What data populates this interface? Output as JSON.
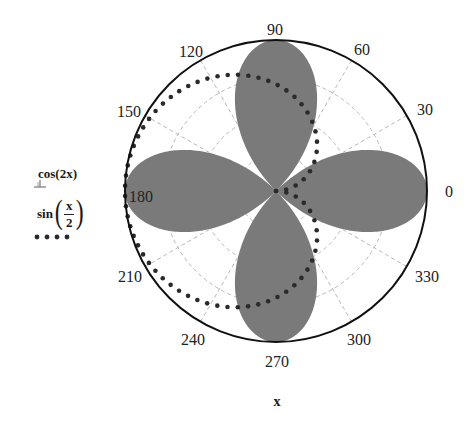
{
  "chart_data": {
    "type": "polar",
    "title": "",
    "xlabel": "x",
    "ylabel": "",
    "theta_unit": "degrees",
    "theta_ticks": [
      0,
      30,
      60,
      90,
      120,
      150,
      180,
      210,
      240,
      270,
      300,
      330
    ],
    "theta_tick_labels": [
      "0",
      "30",
      "60",
      "90",
      "120",
      "150",
      "180",
      "210",
      "240",
      "270",
      "300",
      "330"
    ],
    "r_range": [
      0,
      1
    ],
    "grid": {
      "on": true,
      "style": "dashed",
      "color": "#b8b8b8",
      "radial_lines_every_deg": 30,
      "circles_r": [
        0.25,
        0.5,
        0.75
      ]
    },
    "legend_position": "left",
    "series": [
      {
        "name": "cos(2x)",
        "expression": "r = cos(2x)",
        "style": "filled",
        "color": "#7a7a7a",
        "description": "four-petal rose with petals along 0, 90, 180, 270 degrees, max r = 1",
        "sample_points": [
          {
            "theta": 0,
            "r": 1
          },
          {
            "theta": 15,
            "r": 0.866
          },
          {
            "theta": 30,
            "r": 0.5
          },
          {
            "theta": 45,
            "r": 0
          },
          {
            "theta": 60,
            "r": -0.5
          },
          {
            "theta": 75,
            "r": -0.866
          },
          {
            "theta": 90,
            "r": -1
          },
          {
            "theta": 135,
            "r": 0
          },
          {
            "theta": 180,
            "r": 1
          },
          {
            "theta": 225,
            "r": 0
          },
          {
            "theta": 270,
            "r": -1
          },
          {
            "theta": 315,
            "r": 0
          },
          {
            "theta": 360,
            "r": 1
          }
        ]
      },
      {
        "name": "sin(x/2)",
        "expression": "r = sin(x/2)",
        "style": "dotted",
        "color": "#2a2a2a",
        "description": "cardioid-like loop from origin, reaching r = 1 at 180 degrees",
        "sample_points": [
          {
            "theta": 0,
            "r": 0
          },
          {
            "theta": 30,
            "r": 0.259
          },
          {
            "theta": 60,
            "r": 0.5
          },
          {
            "theta": 90,
            "r": 0.707
          },
          {
            "theta": 120,
            "r": 0.866
          },
          {
            "theta": 150,
            "r": 0.966
          },
          {
            "theta": 180,
            "r": 1
          },
          {
            "theta": 210,
            "r": 0.966
          },
          {
            "theta": 240,
            "r": 0.866
          },
          {
            "theta": 270,
            "r": 0.707
          },
          {
            "theta": 300,
            "r": 0.5
          },
          {
            "theta": 330,
            "r": 0.259
          },
          {
            "theta": 360,
            "r": 0
          }
        ]
      }
    ]
  },
  "plot": {
    "center": [
      276,
      191
    ],
    "radius": 151,
    "outer_circle_color": "#111111",
    "petal_color": "#7a7a7a",
    "dot_color": "#2a2a2a"
  },
  "labels": {
    "xlabel": "x",
    "ticks": [
      {
        "text": "0",
        "x": 449,
        "y": 192
      },
      {
        "text": "30",
        "x": 425,
        "y": 110
      },
      {
        "text": "60",
        "x": 362,
        "y": 50
      },
      {
        "text": "90",
        "x": 275,
        "y": 30
      },
      {
        "text": "120",
        "x": 191,
        "y": 52
      },
      {
        "text": "150",
        "x": 129,
        "y": 112
      },
      {
        "text": "180",
        "x": 141,
        "y": 197
      },
      {
        "text": "210",
        "x": 130,
        "y": 277
      },
      {
        "text": "240",
        "x": 193,
        "y": 340
      },
      {
        "text": "270",
        "x": 277,
        "y": 362
      },
      {
        "text": "300",
        "x": 359,
        "y": 340
      },
      {
        "text": "330",
        "x": 427,
        "y": 277
      }
    ]
  },
  "legend": {
    "cos_label": "cos(2x)",
    "sin_func": "sin",
    "sin_num": "x",
    "sin_den": "2",
    "paren_open": "(",
    "paren_close": ")"
  }
}
